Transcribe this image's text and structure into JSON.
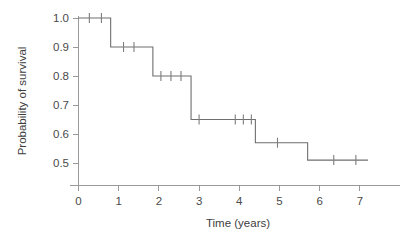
{
  "chart_data": {
    "type": "line",
    "subtype": "kaplan-meier-step",
    "title": "",
    "xlabel": "Time (years)",
    "ylabel": "Probability of survival",
    "xlim": [
      0,
      7.4
    ],
    "ylim": [
      0.44,
      1.03
    ],
    "grid": false,
    "legend": null,
    "x_ticks": [
      0,
      1,
      2,
      3,
      4,
      5,
      6,
      7
    ],
    "x_tick_labels": [
      "0",
      "1",
      "2",
      "3",
      "4",
      "5",
      "6",
      "7"
    ],
    "y_ticks": [
      0.5,
      0.6,
      0.7,
      0.8,
      0.9,
      1.0
    ],
    "y_tick_labels": [
      "0.5",
      "0.6",
      "0.7",
      "0.8",
      "0.9",
      "1.0"
    ],
    "series": [
      {
        "name": "Survival",
        "step_points": [
          {
            "time": 0.0,
            "survival": 1.0
          },
          {
            "time": 0.8,
            "survival": 0.9
          },
          {
            "time": 1.85,
            "survival": 0.8
          },
          {
            "time": 2.8,
            "survival": 0.65
          },
          {
            "time": 4.4,
            "survival": 0.57
          },
          {
            "time": 5.7,
            "survival": 0.51
          },
          {
            "time": 7.2,
            "survival": 0.51
          }
        ],
        "censored_times": [
          0.27,
          0.57,
          1.12,
          1.38,
          2.05,
          2.3,
          2.55,
          3.0,
          3.9,
          4.1,
          4.3,
          4.95,
          6.35,
          6.9
        ],
        "censored_survival": [
          1.0,
          1.0,
          0.9,
          0.9,
          0.8,
          0.8,
          0.8,
          0.65,
          0.65,
          0.65,
          0.65,
          0.57,
          0.51,
          0.51
        ]
      }
    ],
    "colors": {
      "curve": "#6f6f6f",
      "axis": "#9a9a9a",
      "text": "#4a4a4a",
      "background": "#ffffff"
    }
  }
}
